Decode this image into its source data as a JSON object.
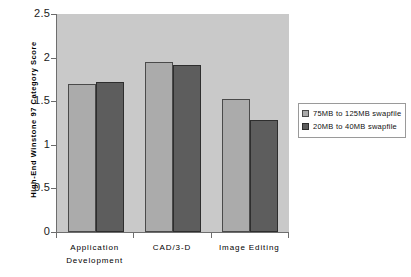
{
  "chart_data": {
    "type": "bar",
    "title": "",
    "xlabel": "",
    "ylabel": "High-End Winstone 97 Category Score",
    "ylim": [
      0,
      2.5
    ],
    "yticks": [
      "0",
      "0.5",
      "1",
      "1.5",
      "2",
      "2.5"
    ],
    "grid": false,
    "legend_position": "right",
    "categories": [
      "Application Development",
      "CAD/3-D",
      "Image Editing"
    ],
    "category_lines": [
      [
        "Application",
        "Development"
      ],
      [
        "CAD/3-D"
      ],
      [
        "Image Editing"
      ]
    ],
    "series": [
      {
        "name": "75MB to 125MB swapfile",
        "color": "#ababab",
        "values": [
          1.7,
          1.95,
          1.52
        ]
      },
      {
        "name": "20MB to 40MB swapfile",
        "color": "#5d5d5d",
        "values": [
          1.72,
          1.91,
          1.29
        ]
      }
    ]
  },
  "legend": {
    "items": [
      {
        "label": "75MB to 125MB swapfile"
      },
      {
        "label": "20MB to 40MB swapfile"
      }
    ]
  },
  "axes": {
    "y_title": "High-End Winstone 97 Category Score"
  }
}
